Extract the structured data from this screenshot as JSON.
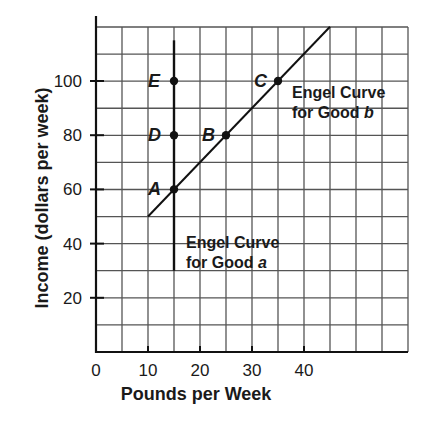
{
  "chart_data": {
    "type": "line",
    "title": "",
    "xlabel": "Pounds per Week",
    "ylabel": "Income (dollars per week)",
    "xlim": [
      0,
      60
    ],
    "ylim": [
      0,
      125
    ],
    "xticks": [
      "0",
      "10",
      "20",
      "30",
      "40"
    ],
    "yticks": [
      "20",
      "40",
      "60",
      "80",
      "100"
    ],
    "grid": true,
    "series": [
      {
        "name": "Engel Curve for Good a",
        "x": [
          15,
          15
        ],
        "y": [
          30,
          115
        ]
      },
      {
        "name": "Engel Curve for Good b",
        "x": [
          10,
          45
        ],
        "y": [
          50,
          120
        ]
      }
    ],
    "points": [
      {
        "label": "A",
        "x": 15,
        "y": 60
      },
      {
        "label": "B",
        "x": 25,
        "y": 80
      },
      {
        "label": "C",
        "x": 35,
        "y": 100
      },
      {
        "label": "D",
        "x": 15,
        "y": 80
      },
      {
        "label": "E",
        "x": 15,
        "y": 100
      }
    ],
    "annotations": [
      {
        "text_line1": "Engel Curve",
        "text_line2": "for Good ",
        "good": "b"
      },
      {
        "text_line1": "Engel Curve",
        "text_line2": "for Good ",
        "good": "a"
      }
    ]
  }
}
